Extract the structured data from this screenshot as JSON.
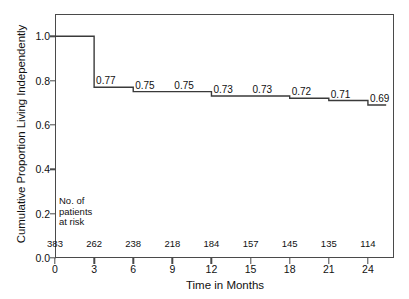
{
  "chart_data": {
    "type": "line",
    "subtype": "kaplan-meier-step",
    "title": "",
    "xlabel": "Time in Months",
    "ylabel": "Cumulative Proportion Living Independently",
    "xlim": [
      0,
      26
    ],
    "ylim": [
      0.0,
      1.1
    ],
    "grid": false,
    "legend": null,
    "x_ticks": [
      "0",
      "3",
      "6",
      "9",
      "12",
      "15",
      "18",
      "21",
      "24"
    ],
    "x_tick_values": [
      0,
      3,
      6,
      9,
      12,
      15,
      18,
      21,
      24
    ],
    "y_ticks": [
      "0.0",
      "0.2",
      "0.4",
      "0.6",
      "0.8",
      "1.0"
    ],
    "y_tick_values": [
      0.0,
      0.2,
      0.4,
      0.6,
      0.8,
      1.0
    ],
    "x": [
      0,
      3,
      6,
      9,
      12,
      15,
      18,
      21,
      24,
      25.4
    ],
    "values": [
      1.0,
      0.77,
      0.75,
      0.75,
      0.73,
      0.73,
      0.72,
      0.71,
      0.69,
      0.69
    ],
    "point_labels": [
      "0.77",
      "0.75",
      "0.75",
      "0.73",
      "0.73",
      "0.72",
      "0.71",
      "0.69"
    ],
    "label_x_values": [
      3,
      6,
      9,
      12,
      15,
      18,
      21,
      24
    ],
    "label_y_values": [
      0.77,
      0.75,
      0.75,
      0.73,
      0.73,
      0.72,
      0.71,
      0.69
    ],
    "line_color": "#3a3a3a",
    "axis_color": "#4a4a4a",
    "background_color": "#ffffff",
    "at_risk": {
      "caption_lines": [
        "No. of",
        "patients",
        "at risk"
      ],
      "times": [
        0,
        3,
        6,
        9,
        12,
        15,
        18,
        21,
        24
      ],
      "counts": [
        "383",
        "262",
        "238",
        "218",
        "184",
        "157",
        "145",
        "135",
        "114"
      ]
    }
  }
}
